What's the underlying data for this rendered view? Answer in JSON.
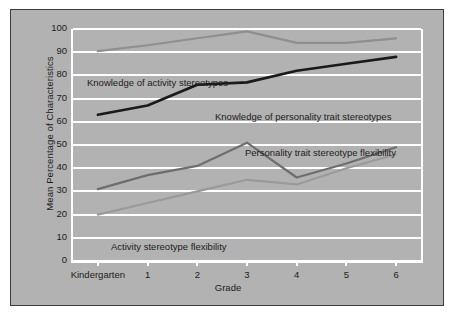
{
  "chart_data": {
    "type": "line",
    "title": "",
    "xlabel": "Grade",
    "ylabel": "Mean Percentage of Characteristics",
    "categories": [
      "Kindergarten",
      "1",
      "2",
      "3",
      "4",
      "5",
      "6"
    ],
    "ylim": [
      0,
      100
    ],
    "yticks": [
      0,
      10,
      20,
      30,
      40,
      50,
      60,
      70,
      80,
      90,
      100
    ],
    "grid": true,
    "legend_position": "inline-annotations",
    "series": [
      {
        "name": "Knowledge of activity stereotypes",
        "color": "#8f8f8f",
        "width": 2.2,
        "values": [
          90.5,
          93,
          96,
          99,
          94,
          94,
          96
        ]
      },
      {
        "name": "Knowledge of personality trait stereotypes",
        "color": "#1a1a1a",
        "width": 2.6,
        "values": [
          63,
          67,
          76,
          77,
          82,
          85,
          88
        ]
      },
      {
        "name": "Personality trait stereotype flexibility",
        "color": "#6e6e6e",
        "width": 2.2,
        "values": [
          31,
          37,
          41,
          51,
          36,
          42,
          49
        ]
      },
      {
        "name": "Activity stereotype flexibility",
        "color": "#9a9a9a",
        "width": 2.2,
        "values": [
          20,
          25,
          30,
          35,
          33,
          40,
          46
        ]
      }
    ],
    "annotations": [
      {
        "text": "Knowledge of activity stereotypes",
        "x": 14,
        "y": 48
      },
      {
        "text": "Knowledge of personality trait stereotypes",
        "x": 142,
        "y": 82
      },
      {
        "text": "Personality trait stereotype flexibility",
        "x": 172,
        "y": 118
      },
      {
        "text": "Activity stereotype flexibility",
        "x": 38,
        "y": 212
      }
    ]
  },
  "colors": {
    "panel_background": "#b2b2b2",
    "page_background": "#ffffff",
    "panel_border": "#3c3c3c",
    "gridline": "#ffffff",
    "text": "#1c1c1c"
  }
}
